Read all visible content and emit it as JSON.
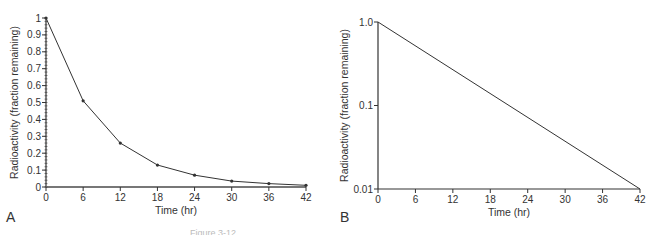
{
  "chart_data": [
    {
      "panel": "A",
      "type": "line",
      "title": "",
      "xlabel": "Time (hr)",
      "ylabel": "Radioactivity (fraction remaining)",
      "yscale": "linear",
      "xlim": [
        0,
        42
      ],
      "ylim": [
        0,
        1
      ],
      "xticks": [
        0,
        6,
        12,
        18,
        24,
        30,
        36,
        42
      ],
      "yticks": [
        0,
        0.1,
        0.2,
        0.3,
        0.4,
        0.5,
        0.6,
        0.7,
        0.8,
        0.9,
        1
      ],
      "ytick_labels": [
        "0",
        "0.1",
        "0.2",
        "0.3",
        "0.4",
        "0.5",
        "0.6",
        "0.7",
        "0.8",
        "0.9",
        "1"
      ],
      "grid": false,
      "series": [
        {
          "name": "radioactivity",
          "x": [
            0,
            6,
            12,
            18,
            24,
            30,
            36,
            42
          ],
          "y": [
            1,
            0.51,
            0.26,
            0.13,
            0.07,
            0.035,
            0.02,
            0.01
          ],
          "markers": true
        }
      ]
    },
    {
      "panel": "B",
      "type": "line",
      "title": "",
      "xlabel": "Time (hr)",
      "ylabel": "Radioactivity (fraction remaining)",
      "yscale": "log",
      "xlim": [
        0,
        42
      ],
      "ylim": [
        0.01,
        1
      ],
      "xticks": [
        0,
        6,
        12,
        18,
        24,
        30,
        36,
        42
      ],
      "yticks": [
        0.01,
        0.1,
        1
      ],
      "ytick_labels": [
        "0.01",
        "0.1",
        "1.0"
      ],
      "grid": false,
      "series": [
        {
          "name": "radioactivity",
          "x": [
            0,
            42
          ],
          "y": [
            1,
            0.01
          ],
          "markers": false
        }
      ]
    }
  ],
  "panels": {
    "a_label": "A",
    "b_label": "B"
  },
  "caption": "Figure 3-12"
}
